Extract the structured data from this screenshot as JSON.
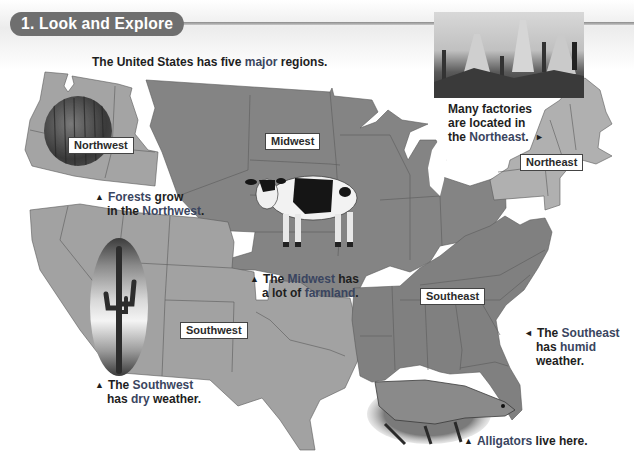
{
  "section": {
    "title": "1. Look and Explore"
  },
  "intro": {
    "before": "The United States has five ",
    "keyword": "major",
    "after": " regions."
  },
  "regions": [
    {
      "id": "northwest",
      "label": "Northwest",
      "fill": "#a4a4a4"
    },
    {
      "id": "midwest",
      "label": "Midwest",
      "fill": "#848484"
    },
    {
      "id": "northeast",
      "label": "Northeast",
      "fill": "#b0b0b0"
    },
    {
      "id": "southwest",
      "label": "Southwest",
      "fill": "#a2a2a2"
    },
    {
      "id": "southeast",
      "label": "Southeast",
      "fill": "#808080"
    }
  ],
  "captions": {
    "northwest": {
      "marker": "▲",
      "kw": "Forests",
      "line1_rest": " grow",
      "line2_pre": "in the ",
      "line2_kw": "Northwest",
      "line2_post": "."
    },
    "midwest": {
      "marker": "▲",
      "line1_pre": "The ",
      "line1_kw": "Midwest",
      "line1_post": " has",
      "line2_pre": "a lot of ",
      "line2_kw": "farmland",
      "line2_post": "."
    },
    "northeast": {
      "marker": "►",
      "line1_pre": "Many ",
      "line1_kw": "factories",
      "line2": "are located in",
      "line3_pre": "the ",
      "line3_kw": "Northeast",
      "line3_post": "."
    },
    "southwest": {
      "marker": "▲",
      "line1_pre": "The ",
      "line1_kw": "Southwest",
      "line2_pre": "has ",
      "line2_kw": "dry",
      "line2_post": " weather."
    },
    "southeast": {
      "marker": "◄",
      "line1_pre": "The ",
      "line1_kw": "Southeast",
      "line2_pre": "has ",
      "line2_kw": "humid",
      "line3": "weather."
    },
    "alligators": {
      "marker": "▲",
      "kw": "Alligators",
      "rest": " live here."
    }
  },
  "images": {
    "forest": "forest-photo",
    "cow": "cow-photo",
    "factory": "factory-photo",
    "cactus": "cactus-photo",
    "alligator": "alligator-photo"
  },
  "colors": {
    "keyword": "#3a4560",
    "pill": "#6f6f6f",
    "text": "#1e1e1e"
  }
}
